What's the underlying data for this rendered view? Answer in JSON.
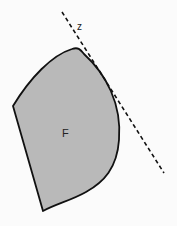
{
  "diagram": {
    "region_label": "F",
    "line_label": "z",
    "colors": {
      "background": "#fbfbfb",
      "region_fill": "#b9b9b9",
      "region_stroke": "#111111",
      "line_stroke": "#111111"
    },
    "elements": [
      {
        "type": "convex-region",
        "label": "F"
      },
      {
        "type": "dashed-tangent-line",
        "label": "z"
      }
    ]
  }
}
